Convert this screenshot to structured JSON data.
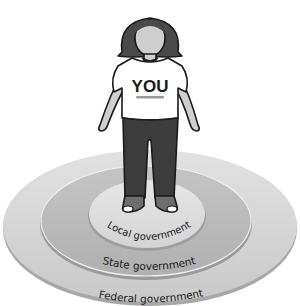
{
  "diagram": {
    "center_figure": {
      "shirt_text": "YOU"
    },
    "rings": [
      {
        "id": "local",
        "label": "Local government",
        "color": "#d9d9d9"
      },
      {
        "id": "state",
        "label": "State government",
        "color": "#bdbdbd"
      },
      {
        "id": "federal",
        "label": "Federal government",
        "color": "#cfcfcf"
      }
    ],
    "colors": {
      "hair": "#4a4a4a",
      "skin": "#cfcfcf",
      "shirt": "#ffffff",
      "pants": "#3c3c3c",
      "shoes": "#6e6e6e",
      "outline": "#1a1a1a"
    }
  }
}
